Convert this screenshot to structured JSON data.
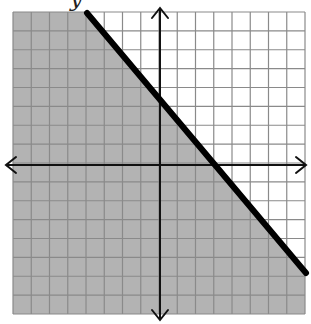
{
  "title_fragment": "y",
  "graph": {
    "type": "linear_inequality_graph",
    "grid": {
      "columns": 16,
      "rows": 16,
      "x_range": [
        -8,
        8
      ],
      "y_range": [
        -8,
        8
      ],
      "pixel_left": 13,
      "pixel_top": 12,
      "pixel_right": 305,
      "pixel_bottom": 314,
      "origin_px": [
        160,
        165
      ]
    },
    "boundary_line": {
      "equation": "y = -x + 3",
      "slope": -1,
      "y_intercept": 3,
      "x_intercept": 3,
      "style": "solid",
      "start_px": [
        87,
        13
      ],
      "end_px": [
        306,
        273
      ]
    },
    "shaded_region": "below the line (y <= -x + 3)",
    "colors": {
      "shade": "#b3b3b3",
      "grid_line_shaded": "#8a8a8a",
      "grid_line_unshaded": "#9a9a9a",
      "axis": "#111111",
      "boundary": "#000000",
      "background": "#ffffff"
    }
  }
}
